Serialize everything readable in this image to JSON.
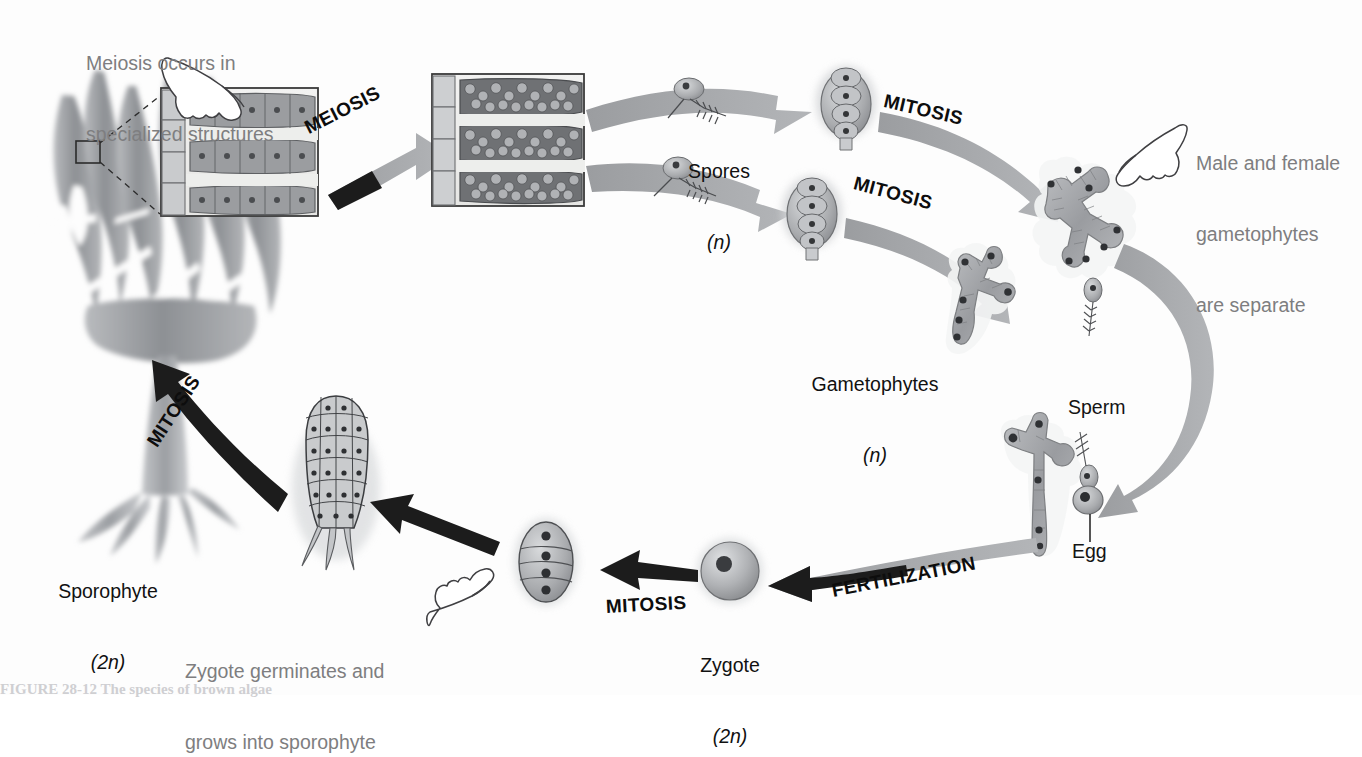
{
  "figure": {
    "background_color": "#fdfdfd",
    "label_gray_color": "#7e7e80",
    "label_dark_color": "#141414",
    "arrow_gray_color": "#a7a9ab",
    "arrow_black_color": "#1a1a1a",
    "organism_fill": "#9fa1a4"
  },
  "annotations": {
    "meiosis_note": {
      "line1": "Meiosis occurs in",
      "line2": "specialized structures"
    },
    "gametophyte_note": {
      "line1": "Male and female",
      "line2": "gametophytes",
      "line3": "are separate"
    },
    "zygote_note": {
      "line1": "Zygote germinates and",
      "line2": "grows into sporophyte"
    }
  },
  "stage_labels": {
    "sporophyte": {
      "name": "Sporophyte",
      "ploidy": "(2n)"
    },
    "spores": {
      "name": "Spores",
      "ploidy": "(n)"
    },
    "gametophytes": {
      "name": "Gametophytes",
      "ploidy": "(n)"
    },
    "sperm": {
      "name": "Sperm"
    },
    "egg": {
      "name": "Egg"
    },
    "zygote": {
      "name": "Zygote",
      "ploidy": "(2n)"
    }
  },
  "processes": {
    "meiosis": "MEIOSIS",
    "mitosis_upper": "MITOSIS",
    "mitosis_lower": "MITOSIS",
    "mitosis_embryo": "MITOSIS",
    "mitosis_sporophyte": "MITOSIS",
    "fertilization": "FERTILIZATION"
  },
  "icons": {
    "pointing_hand_meiosis": "pointing-hand-icon",
    "pointing_hand_gametophyte": "pointing-hand-icon",
    "pointing_hand_zygote": "pointing-hand-icon",
    "magnify_box": "magnification-callout-icon"
  },
  "caption": {
    "text": "FIGURE 28-12 The species of brown algae"
  }
}
